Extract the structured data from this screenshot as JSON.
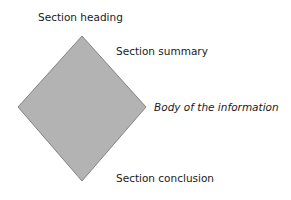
{
  "diagram": {
    "shape": {
      "type": "diamond",
      "fill": "#b3b3b3",
      "stroke": "#6e6e6e",
      "points": [
        [
          82,
          36
        ],
        [
          146,
          107
        ],
        [
          82,
          181
        ],
        [
          18,
          107
        ]
      ]
    },
    "labels": {
      "heading": "Section heading",
      "summary": "Section summary",
      "body": "Body of the information",
      "conclusion": "Section conclusion"
    }
  }
}
